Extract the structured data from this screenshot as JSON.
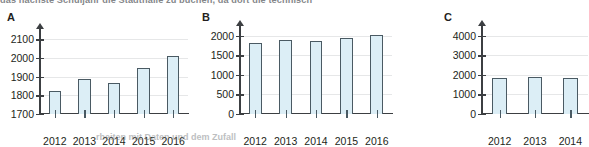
{
  "header": {
    "clipped_text": "das nächste Schuljahr die Stadthalle zu buchen, da dort die technisch"
  },
  "footer": {
    "clipped_text": "rbeiten mit Daten und dem Zufall"
  },
  "chart_data": [
    {
      "type": "bar",
      "panel": "A",
      "title": "A",
      "xlabel": "",
      "ylabel": "",
      "categories": [
        "2012",
        "2013",
        "2014",
        "2015",
        "2016"
      ],
      "values": [
        1825,
        1890,
        1865,
        1945,
        2010
      ],
      "ylim": [
        1700,
        2150
      ],
      "yticks": [
        1700,
        1800,
        1900,
        2000,
        2100
      ],
      "ytick_labels": [
        "1700",
        "1800",
        "1900",
        "2000",
        "2100"
      ],
      "grid": true,
      "legend": "none",
      "bar_fill": "#dceef6",
      "bar_stroke": "#4a5a63"
    },
    {
      "type": "bar",
      "panel": "B",
      "title": "B",
      "xlabel": "",
      "ylabel": "",
      "categories": [
        "2012",
        "2013",
        "2014",
        "2015",
        "2016"
      ],
      "values": [
        1825,
        1890,
        1865,
        1945,
        2010
      ],
      "ylim": [
        0,
        2150
      ],
      "yticks": [
        0,
        500,
        1000,
        1500,
        2000
      ],
      "ytick_labels": [
        "0",
        "500",
        "1000",
        "1500",
        "2000"
      ],
      "grid": true,
      "legend": "none",
      "bar_fill": "#dceef6",
      "bar_stroke": "#4a5a63"
    },
    {
      "type": "bar",
      "panel": "C",
      "title": "C",
      "xlabel": "",
      "ylabel": "",
      "categories": [
        "2012",
        "2013",
        "2014"
      ],
      "values": [
        1825,
        1890,
        1865
      ],
      "ylim": [
        0,
        4300
      ],
      "yticks": [
        0,
        1000,
        2000,
        3000,
        4000
      ],
      "ytick_labels": [
        "0",
        "1000",
        "2000",
        "3000",
        "4000"
      ],
      "grid": true,
      "legend": "none",
      "bar_fill": "#dceef6",
      "bar_stroke": "#4a5a63"
    }
  ],
  "colors": {
    "bar_fill": "#dceef6",
    "bar_stroke": "#4a5a63",
    "axis": "#3c3f42",
    "grid": "#e6e7e8",
    "text": "#231f20"
  }
}
